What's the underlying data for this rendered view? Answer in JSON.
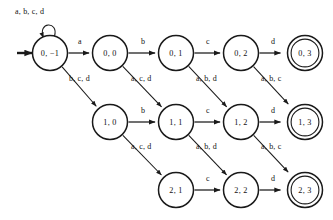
{
  "diagram": {
    "type": "finite-automaton-state-diagram",
    "alphabet": [
      "a",
      "b",
      "c",
      "d"
    ],
    "start_state": "0, −1",
    "accepting_states": [
      "0, 3",
      "1, 3",
      "2, 3"
    ],
    "states": [
      {
        "id": "s0m1",
        "label": "0, −1",
        "cx": 50,
        "cy": 53,
        "r": 17.5,
        "accepting": false,
        "start": true
      },
      {
        "id": "s00",
        "label": "0, 0",
        "cx": 110,
        "cy": 53,
        "r": 17.5,
        "accepting": false,
        "start": false
      },
      {
        "id": "s01",
        "label": "0, 1",
        "cx": 176,
        "cy": 53,
        "r": 17.5,
        "accepting": false,
        "start": false
      },
      {
        "id": "s02",
        "label": "0, 2",
        "cx": 241,
        "cy": 53,
        "r": 17.5,
        "accepting": false,
        "start": false
      },
      {
        "id": "s03",
        "label": "0, 3",
        "cx": 305,
        "cy": 53,
        "r": 17.5,
        "accepting": true,
        "start": false
      },
      {
        "id": "s10",
        "label": "1, 0",
        "cx": 110,
        "cy": 122,
        "r": 17.5,
        "accepting": false,
        "start": false
      },
      {
        "id": "s11",
        "label": "1, 1",
        "cx": 176,
        "cy": 122,
        "r": 17.5,
        "accepting": false,
        "start": false
      },
      {
        "id": "s12",
        "label": "1, 2",
        "cx": 241,
        "cy": 122,
        "r": 17.5,
        "accepting": false,
        "start": false
      },
      {
        "id": "s13",
        "label": "1, 3",
        "cx": 305,
        "cy": 122,
        "r": 17.5,
        "accepting": true,
        "start": false
      },
      {
        "id": "s21",
        "label": "2, 1",
        "cx": 176,
        "cy": 190,
        "r": 17.5,
        "accepting": false,
        "start": false
      },
      {
        "id": "s22",
        "label": "2, 2",
        "cx": 241,
        "cy": 190,
        "r": 17.5,
        "accepting": false,
        "start": false
      },
      {
        "id": "s23",
        "label": "2, 3",
        "cx": 305,
        "cy": 190,
        "r": 17.5,
        "accepting": true,
        "start": false
      }
    ],
    "self_loop": {
      "state": "0, −1",
      "label": "a, b, c, d",
      "label_x": 15,
      "label_y": 14
    },
    "start_marker": {
      "label": "",
      "x1": 17,
      "y1": 53,
      "x2": 32,
      "y2": 53
    },
    "transitions": [
      {
        "from": "0, −1",
        "to": "0, 0",
        "label": "a",
        "kind": "horizontal",
        "label_x": 80,
        "label_y": 44
      },
      {
        "from": "0, 0",
        "to": "0, 1",
        "label": "b",
        "kind": "horizontal",
        "label_x": 143,
        "label_y": 44
      },
      {
        "from": "0, 1",
        "to": "0, 2",
        "label": "c",
        "kind": "horizontal",
        "label_x": 208,
        "label_y": 44
      },
      {
        "from": "0, 2",
        "to": "0, 3",
        "label": "d",
        "kind": "horizontal",
        "label_x": 273,
        "label_y": 44
      },
      {
        "from": "1, 0",
        "to": "1, 1",
        "label": "b",
        "kind": "horizontal",
        "label_x": 143,
        "label_y": 113
      },
      {
        "from": "1, 1",
        "to": "1, 2",
        "label": "c",
        "kind": "horizontal",
        "label_x": 208,
        "label_y": 113
      },
      {
        "from": "1, 2",
        "to": "1, 3",
        "label": "d",
        "kind": "horizontal",
        "label_x": 273,
        "label_y": 113
      },
      {
        "from": "2, 1",
        "to": "2, 2",
        "label": "c",
        "kind": "horizontal",
        "label_x": 208,
        "label_y": 181
      },
      {
        "from": "2, 2",
        "to": "2, 3",
        "label": "d",
        "kind": "horizontal",
        "label_x": 273,
        "label_y": 181
      },
      {
        "from": "0, −1",
        "to": "1, 0",
        "label": "b, c, d",
        "kind": "diagonal",
        "label_x": 69,
        "label_y": 81
      },
      {
        "from": "0, 0",
        "to": "1, 1",
        "label": "a, c, d",
        "kind": "diagonal",
        "label_x": 131,
        "label_y": 81
      },
      {
        "from": "0, 1",
        "to": "1, 2",
        "label": "a, b, d",
        "kind": "diagonal",
        "label_x": 196,
        "label_y": 81
      },
      {
        "from": "0, 2",
        "to": "1, 3",
        "label": "a, b, c",
        "kind": "diagonal",
        "label_x": 261,
        "label_y": 81
      },
      {
        "from": "1, 0",
        "to": "2, 1",
        "label": "a, c, d",
        "kind": "diagonal",
        "label_x": 131,
        "label_y": 149
      },
      {
        "from": "1, 1",
        "to": "2, 2",
        "label": "a, b, d",
        "kind": "diagonal",
        "label_x": 196,
        "label_y": 149
      },
      {
        "from": "1, 2",
        "to": "2, 3",
        "label": "a, b, c",
        "kind": "diagonal",
        "label_x": 261,
        "label_y": 149
      }
    ],
    "colors": {
      "stroke": "#1a1a1a",
      "text": "#111111",
      "background": "#ffffff"
    }
  }
}
